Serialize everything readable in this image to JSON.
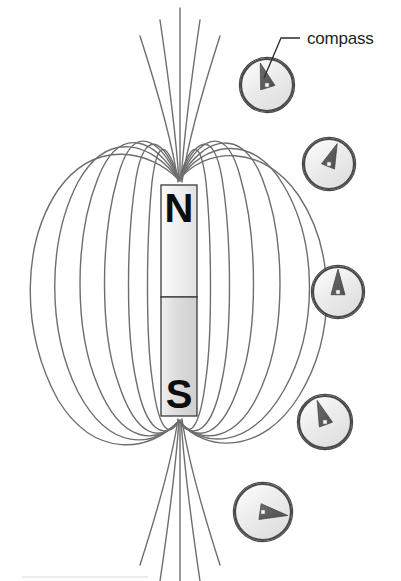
{
  "figure": {
    "background_color": "#ffffff",
    "width": 401,
    "height": 581
  },
  "annotation": {
    "label": "compass",
    "label_x": 307,
    "label_y": 44,
    "leader": {
      "name": "leader-line",
      "color": "#2b2b2b",
      "points": "300,38 281,38 264,78"
    }
  },
  "magnet": {
    "name": "bar-magnet",
    "x": 161,
    "y": 185,
    "width": 36,
    "height": 231,
    "divider_y": 297,
    "outline_color": "#333333",
    "fill_top": "#f2f2f2",
    "fill_bottom": "#d8d8d8",
    "north_label": "N",
    "south_label": "S",
    "north_label_x": 179,
    "north_label_y": 222,
    "south_label_x": 179,
    "south_label_y": 408
  },
  "field": {
    "name": "magnetic-field-lines",
    "stroke_color": "#6e6e6e",
    "stroke_width": 1.4,
    "loops": [
      "M 179 180 C 150 150 95 138 58 190 C 22 244 20 330 58 400 C 95 460 150 452 179 421",
      "M 179 180 C 152 143 108 128 78 182 C 48 240 46 328 78 392 C 110 452 152 448 179 421",
      "M 179 180 C 156 140 120 122 98 178 C 74 238 74 330 98 386 C 122 444 156 445 179 421",
      "M 179 180 C 160 139 133 120 118 176 C 100 238 100 332 118 382 C 136 438 160 443 179 421",
      "M 179 180 C 164 140 145 126 136 178 C 126 240 126 334 136 380 C 146 432 164 441 179 421",
      "M 179 180 C 168 144 158 134 152 182 C 146 242 146 336 152 378 C 158 428 168 440 179 421",
      "M 179 180 C 204 148 262 142 299 196 C 336 252 336 336 299 396 C 262 456 204 452 179 421",
      "M 179 180 C 202 144 252 130 284 186 C 318 244 318 330 284 390 C 250 450 202 448 179 421",
      "M 179 180 C 200 141 240 122 262 178 C 286 238 286 330 262 386 C 238 444 200 445 179 421",
      "M 179 180 C 198 139 225 120 240 176 C 258 238 258 332 240 382 C 222 438 198 443 179 421",
      "M 179 180 C 194 140 213 126 222 178 C 232 240 232 334 222 380 C 212 432 194 441 179 421",
      "M 179 180 C 190 144 200 134 206 182 C 212 242 212 336 206 378 C 200 428 190 440 179 421"
    ],
    "open_lines_top": [
      "M 178 182 C 172 140 158 92 140 36",
      "M 179 181 C 176 136 170 88 160 20",
      "M 180 181 C 180 134 180 86 180 8",
      "M 181 181 C 184 136 190 88 200 20",
      "M 182 182 C 188 140 202 92 220 36"
    ],
    "open_lines_bottom": [
      "M 178 419 C 172 461 158 509 140 565",
      "M 179 420 C 176 465 170 513 160 581",
      "M 180 420 C 180 467 180 515 180 581",
      "M 181 420 C 184 465 190 513 200 581",
      "M 182 419 C 188 461 202 509 220 565"
    ]
  },
  "compasses": [
    {
      "name": "compass-1",
      "cx": 267,
      "cy": 85,
      "r": 26,
      "needle_angle_deg": 253,
      "needle_length": 23,
      "needle_half_width": 7.5,
      "face_color": "#f2f2f2",
      "rim_color": "#4a4a4a",
      "needle_color": "#5c5c5c"
    },
    {
      "name": "compass-2",
      "cx": 329,
      "cy": 164,
      "r": 25,
      "needle_angle_deg": 292,
      "needle_length": 22,
      "needle_half_width": 7,
      "face_color": "#f2f2f2",
      "rim_color": "#4a4a4a",
      "needle_color": "#5c5c5c"
    },
    {
      "name": "compass-3",
      "cx": 338,
      "cy": 292,
      "r": 25,
      "needle_angle_deg": 270,
      "needle_length": 23,
      "needle_half_width": 7,
      "face_color": "#f2f2f2",
      "rim_color": "#4a4a4a",
      "needle_color": "#5c5c5c"
    },
    {
      "name": "compass-4",
      "cx": 325,
      "cy": 422,
      "r": 26,
      "needle_angle_deg": 250,
      "needle_length": 23,
      "needle_half_width": 7,
      "face_color": "#f2f2f2",
      "rim_color": "#4a4a4a",
      "needle_color": "#5c5c5c"
    },
    {
      "name": "compass-5",
      "cx": 263,
      "cy": 512,
      "r": 28,
      "needle_angle_deg": 8,
      "needle_length": 25,
      "needle_half_width": 8,
      "face_color": "#f2f2f2",
      "rim_color": "#4a4a4a",
      "needle_color": "#5c5c5c"
    }
  ],
  "footer_rule": {
    "name": "bottom-rule",
    "x1": 22,
    "y1": 577,
    "x2": 148,
    "y2": 577,
    "color": "#d9d9d9"
  }
}
